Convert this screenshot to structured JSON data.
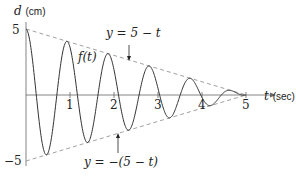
{
  "chart_data": {
    "type": "line",
    "title": "",
    "xlabel": "t (sec)",
    "ylabel": "d (cm)",
    "xlim": [
      0,
      5
    ],
    "ylim": [
      -5,
      5
    ],
    "x_ticks": [
      1,
      2,
      3,
      4,
      5
    ],
    "y_ticks": [
      5,
      -5
    ],
    "grid": false,
    "series": [
      {
        "name": "f(t)",
        "style": "solid",
        "description": "damped oscillation f(t) = (5 - t) cos(2π·1.07·t)",
        "amplitude_expr": "5 - t",
        "frequency_hz": 1.07
      },
      {
        "name": "y = 5 - t",
        "style": "dashed",
        "x": [
          0,
          5
        ],
        "values": [
          5,
          0
        ]
      },
      {
        "name": "y = -(5 - t)",
        "style": "dashed",
        "x": [
          0,
          5
        ],
        "values": [
          -5,
          0
        ]
      }
    ],
    "annotations": [
      {
        "text": "f(t)",
        "points_to": "oscillating curve"
      },
      {
        "text": "y = 5 − t",
        "points_to": "upper envelope",
        "arrow": "down"
      },
      {
        "text": "y = −(5 − t)",
        "points_to": "lower envelope",
        "arrow": "up"
      }
    ]
  },
  "labels": {
    "y_axis_var": "d",
    "y_axis_unit": "(cm)",
    "x_axis_var": "t",
    "x_axis_unit": "(sec)",
    "y_tick_top": "5",
    "y_tick_bottom": "−5",
    "x_ticks": [
      "1",
      "2",
      "3",
      "4",
      "5"
    ],
    "curve_label": "f(t)",
    "upper_envelope": "y = 5 − t",
    "lower_envelope": "y = −(5 − t)"
  },
  "colors": {
    "curve": "#333333",
    "envelope": "#888888",
    "axis": "#555555"
  }
}
